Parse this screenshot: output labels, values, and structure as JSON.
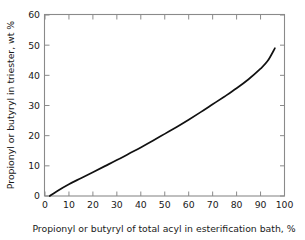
{
  "chart_data": {
    "type": "line",
    "title": "",
    "subtitle": "",
    "xlabel": "Propionyl or butyryl of total acyl in esterification bath, %",
    "ylabel": "Propionyl or butyryl in triester, wt %",
    "xlim": [
      0,
      100
    ],
    "ylim": [
      0,
      60
    ],
    "xticks": [
      0,
      10,
      20,
      30,
      40,
      50,
      60,
      70,
      80,
      90,
      100
    ],
    "yticks": [
      0,
      10,
      20,
      30,
      40,
      50,
      60
    ],
    "xticklabels": [
      "0",
      "10",
      "20",
      "30",
      "40",
      "50",
      "60",
      "70",
      "80",
      "90",
      "100"
    ],
    "yticklabels": [
      "0",
      "10",
      "20",
      "30",
      "40",
      "50",
      "60"
    ],
    "grid": false,
    "legend": false,
    "legend_position": "none",
    "tick_direction": "in",
    "series": [
      {
        "name": "Propionyl or butyryl in triester",
        "color": "#111111",
        "x": [
          2,
          5,
          10,
          15,
          20,
          25,
          30,
          35,
          40,
          45,
          50,
          55,
          60,
          65,
          70,
          75,
          80,
          85,
          90,
          93,
          96
        ],
        "y": [
          0,
          1.6,
          3.9,
          5.9,
          7.9,
          9.9,
          11.9,
          14.0,
          16.1,
          18.3,
          20.6,
          22.9,
          25.3,
          27.8,
          30.4,
          33.0,
          35.7,
          38.7,
          42.2,
          44.8,
          49.0
        ]
      }
    ],
    "annotations": []
  },
  "figure": {
    "background_color": "#ffffff",
    "frame_color": "#8a8a8a",
    "text_color": "#1a1a1a"
  }
}
